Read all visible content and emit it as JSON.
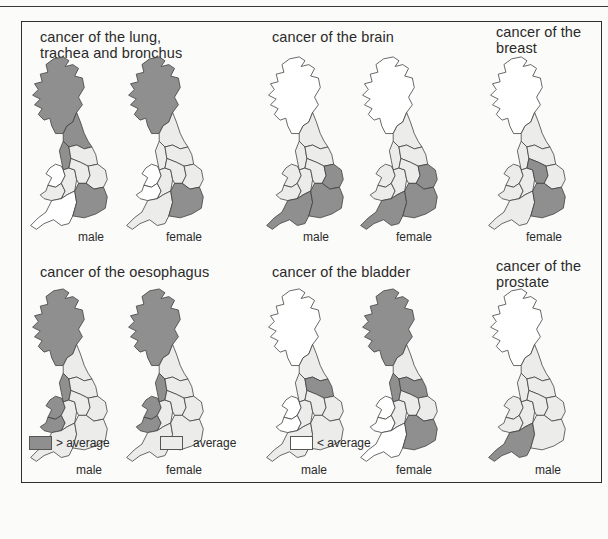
{
  "colors": {
    "above": "#8f8f8f",
    "average": "#ececea",
    "below": "#ffffff",
    "stroke": "#3c3c3c",
    "background": "#fbfbf9"
  },
  "panels": [
    {
      "id": "lung",
      "title_lines": [
        "cancer of the lung,",
        "trachea and bronchus"
      ],
      "maps": [
        {
          "sex": "male",
          "fills": {
            "scotland": "above",
            "north": "above",
            "northwest": "above",
            "yorkshire": "average",
            "wales_north": "below",
            "wales_south": "average",
            "west_midlands": "average",
            "east_midlands": "average",
            "east_anglia": "average",
            "south_west": "below",
            "south_east": "above"
          }
        },
        {
          "sex": "female",
          "fills": {
            "scotland": "above",
            "north": "average",
            "northwest": "average",
            "yorkshire": "average",
            "wales_north": "below",
            "wales_south": "below",
            "west_midlands": "average",
            "east_midlands": "average",
            "east_anglia": "average",
            "south_west": "average",
            "south_east": "above"
          }
        }
      ]
    },
    {
      "id": "brain",
      "title_lines": [
        "cancer of the brain"
      ],
      "maps": [
        {
          "sex": "male",
          "fills": {
            "scotland": "below",
            "north": "average",
            "northwest": "average",
            "yorkshire": "average",
            "wales_north": "average",
            "wales_south": "average",
            "west_midlands": "average",
            "east_midlands": "average",
            "east_anglia": "above",
            "south_west": "above",
            "south_east": "above"
          }
        },
        {
          "sex": "female",
          "fills": {
            "scotland": "below",
            "north": "average",
            "northwest": "average",
            "yorkshire": "average",
            "wales_north": "average",
            "wales_south": "average",
            "west_midlands": "average",
            "east_midlands": "average",
            "east_anglia": "above",
            "south_west": "above",
            "south_east": "above"
          }
        }
      ]
    },
    {
      "id": "breast",
      "title_lines": [
        "cancer of the",
        "breast"
      ],
      "maps": [
        {
          "sex": "female",
          "fills": {
            "scotland": "below",
            "north": "average",
            "northwest": "average",
            "yorkshire": "average",
            "wales_north": "average",
            "wales_south": "average",
            "west_midlands": "average",
            "east_midlands": "above",
            "east_anglia": "average",
            "south_west": "average",
            "south_east": "above"
          }
        }
      ]
    },
    {
      "id": "oesophagus",
      "title_lines": [
        "cancer of the oesophagus"
      ],
      "maps": [
        {
          "sex": "male",
          "fills": {
            "scotland": "above",
            "north": "average",
            "northwest": "above",
            "yorkshire": "average",
            "wales_north": "above",
            "wales_south": "above",
            "west_midlands": "average",
            "east_midlands": "average",
            "east_anglia": "average",
            "south_west": "average",
            "south_east": "average"
          }
        },
        {
          "sex": "female",
          "fills": {
            "scotland": "above",
            "north": "average",
            "northwest": "above",
            "yorkshire": "average",
            "wales_north": "above",
            "wales_south": "above",
            "west_midlands": "average",
            "east_midlands": "average",
            "east_anglia": "average",
            "south_west": "average",
            "south_east": "average"
          }
        }
      ]
    },
    {
      "id": "bladder",
      "title_lines": [
        "cancer of the bladder"
      ],
      "maps": [
        {
          "sex": "male",
          "fills": {
            "scotland": "below",
            "north": "average",
            "northwest": "average",
            "yorkshire": "above",
            "wales_north": "below",
            "wales_south": "below",
            "west_midlands": "average",
            "east_midlands": "average",
            "east_anglia": "average",
            "south_west": "average",
            "south_east": "average"
          }
        },
        {
          "sex": "female",
          "fills": {
            "scotland": "above",
            "north": "average",
            "northwest": "above",
            "yorkshire": "above",
            "wales_north": "below",
            "wales_south": "below",
            "west_midlands": "average",
            "east_midlands": "average",
            "east_anglia": "average",
            "south_west": "below",
            "south_east": "above"
          }
        }
      ]
    },
    {
      "id": "prostate",
      "title_lines": [
        "cancer of the",
        "prostate"
      ],
      "maps": [
        {
          "sex": "male",
          "fills": {
            "scotland": "below",
            "north": "average",
            "northwest": "average",
            "yorkshire": "average",
            "wales_north": "average",
            "wales_south": "average",
            "west_midlands": "average",
            "east_midlands": "average",
            "east_anglia": "average",
            "south_west": "above",
            "south_east": "average"
          }
        }
      ]
    }
  ],
  "legend": [
    {
      "key": "above",
      "label": "> average"
    },
    {
      "key": "average",
      "label": "average"
    },
    {
      "key": "below",
      "label": "< average"
    }
  ],
  "chart_data": {
    "type": "choropleth",
    "categories": [
      "> average",
      "average",
      "< average"
    ],
    "regions": [
      "scotland",
      "north",
      "northwest",
      "yorkshire",
      "wales_north",
      "wales_south",
      "west_midlands",
      "east_midlands",
      "east_anglia",
      "south_west",
      "south_east"
    ],
    "maps": [
      {
        "cancer": "lung, trachea and bronchus",
        "sex": "male"
      },
      {
        "cancer": "lung, trachea and bronchus",
        "sex": "female"
      },
      {
        "cancer": "brain",
        "sex": "male"
      },
      {
        "cancer": "brain",
        "sex": "female"
      },
      {
        "cancer": "breast",
        "sex": "female"
      },
      {
        "cancer": "oesophagus",
        "sex": "male"
      },
      {
        "cancer": "oesophagus",
        "sex": "female"
      },
      {
        "cancer": "bladder",
        "sex": "male"
      },
      {
        "cancer": "bladder",
        "sex": "female"
      },
      {
        "cancer": "prostate",
        "sex": "male"
      }
    ]
  }
}
